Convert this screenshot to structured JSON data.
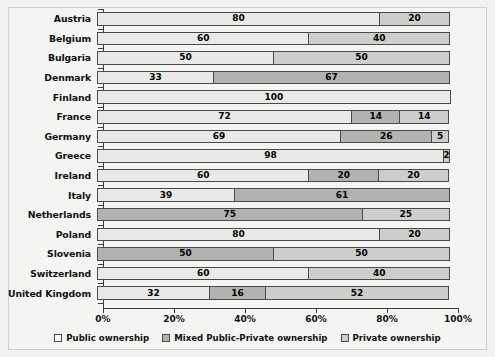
{
  "chart_data": {
    "type": "bar",
    "subtype": "stacked-horizontal-100pct",
    "title": "",
    "xlabel": "",
    "ylabel": "",
    "xlim": [
      0,
      100
    ],
    "xticks": [
      "0%",
      "20%",
      "40%",
      "60%",
      "80%",
      "100%"
    ],
    "xtick_values": [
      0,
      20,
      40,
      60,
      80,
      100
    ],
    "grid": false,
    "legend_position": "bottom-center",
    "categories": [
      "Austria",
      "Belgium",
      "Bulgaria",
      "Denmark",
      "Finland",
      "France",
      "Germany",
      "Greece",
      "Ireland",
      "Italy",
      "Netherlands",
      "Poland",
      "Slovenia",
      "Switzerland",
      "United Kingdom"
    ],
    "series": [
      {
        "name": "Public ownership",
        "key": "public",
        "color": "#e9e9e7",
        "values": [
          80,
          60,
          50,
          33,
          100,
          72,
          69,
          98,
          60,
          39,
          0,
          80,
          0,
          60,
          32
        ]
      },
      {
        "name": "Mixed Public-Private ownership",
        "key": "mixed",
        "color": "#b2b2b0",
        "values": [
          0,
          0,
          0,
          67,
          0,
          14,
          26,
          0,
          20,
          61,
          75,
          0,
          50,
          0,
          16
        ]
      },
      {
        "name": "Private ownership",
        "key": "private",
        "color": "#cdcdcb",
        "values": [
          20,
          40,
          50,
          0,
          0,
          14,
          5,
          2,
          20,
          0,
          25,
          20,
          50,
          40,
          52
        ]
      }
    ],
    "rows": [
      {
        "label": "Austria",
        "segments": [
          {
            "type": "public",
            "value": 80
          },
          {
            "type": "private",
            "value": 20
          }
        ]
      },
      {
        "label": "Belgium",
        "segments": [
          {
            "type": "public",
            "value": 60
          },
          {
            "type": "private",
            "value": 40
          }
        ]
      },
      {
        "label": "Bulgaria",
        "segments": [
          {
            "type": "public",
            "value": 50
          },
          {
            "type": "private",
            "value": 50
          }
        ]
      },
      {
        "label": "Denmark",
        "segments": [
          {
            "type": "public",
            "value": 33
          },
          {
            "type": "mixed",
            "value": 67
          }
        ]
      },
      {
        "label": "Finland",
        "segments": [
          {
            "type": "public",
            "value": 100
          }
        ]
      },
      {
        "label": "France",
        "segments": [
          {
            "type": "public",
            "value": 72
          },
          {
            "type": "mixed",
            "value": 14
          },
          {
            "type": "private",
            "value": 14
          }
        ]
      },
      {
        "label": "Germany",
        "segments": [
          {
            "type": "public",
            "value": 69
          },
          {
            "type": "mixed",
            "value": 26
          },
          {
            "type": "private",
            "value": 5
          }
        ]
      },
      {
        "label": "Greece",
        "segments": [
          {
            "type": "public",
            "value": 98
          },
          {
            "type": "private",
            "value": 2
          }
        ]
      },
      {
        "label": "Ireland",
        "segments": [
          {
            "type": "public",
            "value": 60
          },
          {
            "type": "mixed",
            "value": 20
          },
          {
            "type": "private",
            "value": 20
          }
        ]
      },
      {
        "label": "Italy",
        "segments": [
          {
            "type": "public",
            "value": 39
          },
          {
            "type": "mixed",
            "value": 61
          }
        ]
      },
      {
        "label": "Netherlands",
        "segments": [
          {
            "type": "mixed",
            "value": 75
          },
          {
            "type": "private",
            "value": 25
          }
        ]
      },
      {
        "label": "Poland",
        "segments": [
          {
            "type": "public",
            "value": 80
          },
          {
            "type": "private",
            "value": 20
          }
        ]
      },
      {
        "label": "Slovenia",
        "segments": [
          {
            "type": "mixed",
            "value": 50
          },
          {
            "type": "private",
            "value": 50
          }
        ]
      },
      {
        "label": "Switzerland",
        "segments": [
          {
            "type": "public",
            "value": 60
          },
          {
            "type": "private",
            "value": 40
          }
        ]
      },
      {
        "label": "United Kingdom",
        "segments": [
          {
            "type": "public",
            "value": 32
          },
          {
            "type": "mixed",
            "value": 16
          },
          {
            "type": "private",
            "value": 52
          }
        ]
      }
    ],
    "legend": [
      {
        "label": "Public ownership",
        "key": "public"
      },
      {
        "label": "Mixed Public-Private ownership",
        "key": "mixed"
      },
      {
        "label": "Private ownership",
        "key": "private"
      }
    ]
  }
}
